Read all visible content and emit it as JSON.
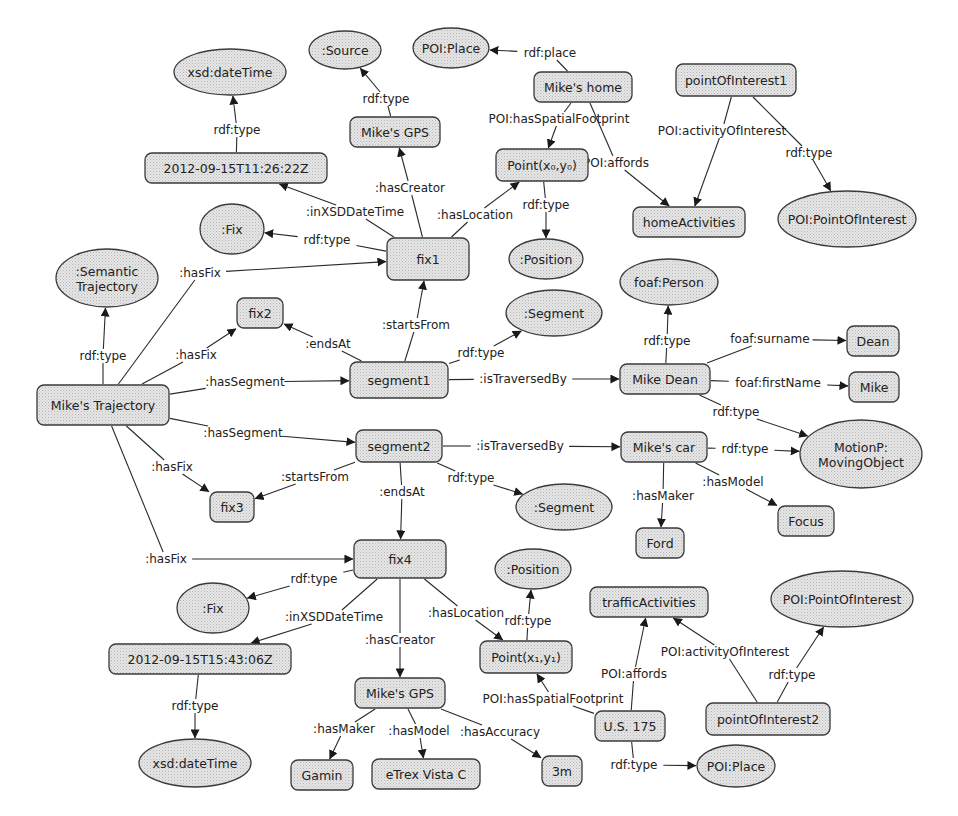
{
  "diagram": {
    "colors": {
      "node_fill": "#d9d9d9",
      "node_stroke": "#3a3a3a",
      "edge": "#2a2a2a",
      "background": "#ffffff"
    },
    "nodes": [
      {
        "id": "xsd_dt1",
        "label": "xsd:dateTime",
        "shape": "ellipse",
        "x": 230,
        "y": 72,
        "w": 112,
        "h": 46
      },
      {
        "id": "source",
        "label": ":Source",
        "shape": "ellipse",
        "x": 345,
        "y": 50,
        "w": 72,
        "h": 38
      },
      {
        "id": "poiplace1",
        "label": "POI:Place",
        "shape": "ellipse",
        "x": 451,
        "y": 48,
        "w": 76,
        "h": 40
      },
      {
        "id": "mikes_home",
        "label": "Mike's home",
        "shape": "rect",
        "x": 583,
        "y": 87,
        "w": 98,
        "h": 30
      },
      {
        "id": "poi1",
        "label": "pointOfInterest1",
        "shape": "rect",
        "x": 736,
        "y": 80,
        "w": 120,
        "h": 32
      },
      {
        "id": "mikes_gps1",
        "label": "Mike's GPS",
        "shape": "rect",
        "x": 395,
        "y": 132,
        "w": 90,
        "h": 30
      },
      {
        "id": "dt1",
        "label": "2012-09-15T11:26:22Z",
        "shape": "rect",
        "x": 236,
        "y": 168,
        "w": 182,
        "h": 30
      },
      {
        "id": "point0",
        "label": "Point(x₀,y₀)",
        "shape": "rect",
        "x": 542,
        "y": 165,
        "w": 92,
        "h": 32
      },
      {
        "id": "fix_class1",
        "label": ":Fix",
        "shape": "ellipse",
        "x": 232,
        "y": 229,
        "w": 64,
        "h": 50
      },
      {
        "id": "fix1",
        "label": "fix1",
        "shape": "rect",
        "x": 428,
        "y": 259,
        "w": 82,
        "h": 42
      },
      {
        "id": "position1",
        "label": ":Position",
        "shape": "ellipse",
        "x": 546,
        "y": 259,
        "w": 74,
        "h": 40
      },
      {
        "id": "homeact",
        "label": "homeActivities",
        "shape": "rect",
        "x": 689,
        "y": 222,
        "w": 112,
        "h": 30
      },
      {
        "id": "poi_class1",
        "label": "POI:PointOfInterest",
        "shape": "ellipse",
        "x": 847,
        "y": 219,
        "w": 138,
        "h": 56
      },
      {
        "id": "sem_traj",
        "label": ":Semantic\nTrajectory",
        "shape": "ellipse",
        "x": 107,
        "y": 278,
        "w": 102,
        "h": 58
      },
      {
        "id": "fix2",
        "label": "fix2",
        "shape": "rect",
        "x": 260,
        "y": 313,
        "w": 46,
        "h": 30
      },
      {
        "id": "segment_class1",
        "label": ":Segment",
        "shape": "ellipse",
        "x": 554,
        "y": 313,
        "w": 96,
        "h": 46
      },
      {
        "id": "foaf_person",
        "label": "foaf:Person",
        "shape": "ellipse",
        "x": 669,
        "y": 282,
        "w": 98,
        "h": 46
      },
      {
        "id": "dean",
        "label": "Dean",
        "shape": "rect",
        "x": 873,
        "y": 341,
        "w": 52,
        "h": 30
      },
      {
        "id": "mikes_traj",
        "label": "Mike's Trajectory",
        "shape": "rect",
        "x": 103,
        "y": 405,
        "w": 132,
        "h": 40
      },
      {
        "id": "segment1",
        "label": "segment1",
        "shape": "rect",
        "x": 399,
        "y": 380,
        "w": 98,
        "h": 36
      },
      {
        "id": "mike_dean",
        "label": "Mike Dean",
        "shape": "rect",
        "x": 665,
        "y": 379,
        "w": 90,
        "h": 30
      },
      {
        "id": "mike",
        "label": "Mike",
        "shape": "rect",
        "x": 874,
        "y": 387,
        "w": 50,
        "h": 30
      },
      {
        "id": "segment2",
        "label": "segment2",
        "shape": "rect",
        "x": 399,
        "y": 446,
        "w": 86,
        "h": 32
      },
      {
        "id": "mikes_car",
        "label": "Mike's car",
        "shape": "rect",
        "x": 664,
        "y": 447,
        "w": 86,
        "h": 30
      },
      {
        "id": "motionp",
        "label": "MotionP:\nMovingObject",
        "shape": "ellipse",
        "x": 861,
        "y": 454,
        "w": 122,
        "h": 68
      },
      {
        "id": "fix3",
        "label": "fix3",
        "shape": "rect",
        "x": 232,
        "y": 507,
        "w": 44,
        "h": 30
      },
      {
        "id": "segment_class2",
        "label": ":Segment",
        "shape": "ellipse",
        "x": 564,
        "y": 507,
        "w": 96,
        "h": 46
      },
      {
        "id": "focus",
        "label": "Focus",
        "shape": "rect",
        "x": 806,
        "y": 521,
        "w": 56,
        "h": 30
      },
      {
        "id": "ford",
        "label": "Ford",
        "shape": "rect",
        "x": 660,
        "y": 543,
        "w": 48,
        "h": 30
      },
      {
        "id": "fix4",
        "label": "fix4",
        "shape": "rect",
        "x": 400,
        "y": 559,
        "w": 92,
        "h": 38
      },
      {
        "id": "position2",
        "label": ":Position",
        "shape": "ellipse",
        "x": 533,
        "y": 569,
        "w": 76,
        "h": 40
      },
      {
        "id": "traffic",
        "label": "trafficActivities",
        "shape": "rect",
        "x": 649,
        "y": 602,
        "w": 118,
        "h": 30
      },
      {
        "id": "poi_class2",
        "label": "POI:PointOfInterest",
        "shape": "ellipse",
        "x": 842,
        "y": 599,
        "w": 142,
        "h": 56
      },
      {
        "id": "fix_class2",
        "label": ":Fix",
        "shape": "ellipse",
        "x": 213,
        "y": 608,
        "w": 72,
        "h": 50
      },
      {
        "id": "dt2",
        "label": "2012-09-15T15:43:06Z",
        "shape": "rect",
        "x": 200,
        "y": 659,
        "w": 182,
        "h": 30
      },
      {
        "id": "point1",
        "label": "Point(x₁,y₁)",
        "shape": "rect",
        "x": 526,
        "y": 657,
        "w": 92,
        "h": 32
      },
      {
        "id": "mikes_gps2",
        "label": "Mike's GPS",
        "shape": "rect",
        "x": 400,
        "y": 693,
        "w": 90,
        "h": 30
      },
      {
        "id": "poi2",
        "label": "pointOfInterest2",
        "shape": "rect",
        "x": 768,
        "y": 719,
        "w": 124,
        "h": 32
      },
      {
        "id": "us175",
        "label": "U.S. 175",
        "shape": "rect",
        "x": 630,
        "y": 726,
        "w": 70,
        "h": 30
      },
      {
        "id": "xsd_dt2",
        "label": "xsd:dateTime",
        "shape": "ellipse",
        "x": 195,
        "y": 763,
        "w": 112,
        "h": 48
      },
      {
        "id": "gamin",
        "label": "Gamin",
        "shape": "rect",
        "x": 322,
        "y": 775,
        "w": 62,
        "h": 30
      },
      {
        "id": "etrex",
        "label": "eTrex Vista C",
        "shape": "rect",
        "x": 426,
        "y": 774,
        "w": 108,
        "h": 30
      },
      {
        "id": "three_m",
        "label": "3m",
        "shape": "rect",
        "x": 562,
        "y": 771,
        "w": 40,
        "h": 30
      },
      {
        "id": "poiplace2",
        "label": "POI:Place",
        "shape": "ellipse",
        "x": 736,
        "y": 766,
        "w": 78,
        "h": 42
      }
    ],
    "edges": [
      {
        "from": "dt1",
        "to": "xsd_dt1",
        "label": "rdf:type",
        "lx": 237,
        "ly": 130
      },
      {
        "from": "mikes_gps1",
        "to": "source",
        "label": "rdf:type",
        "lx": 386,
        "ly": 99
      },
      {
        "from": "mikes_home",
        "to": "poiplace1",
        "label": "rdf:place",
        "lx": 550,
        "ly": 53
      },
      {
        "from": "mikes_home",
        "to": "point0",
        "label": "POI:hasSpatialFootprint",
        "lx": 559,
        "ly": 119
      },
      {
        "from": "mikes_home",
        "to": "homeact",
        "label": "POI:affords",
        "lx": 616,
        "ly": 163
      },
      {
        "from": "poi1",
        "to": "homeact",
        "label": "POI:activityOfInterest",
        "lx": 722,
        "ly": 131
      },
      {
        "from": "poi1",
        "to": "poi_class1",
        "label": "rdf:type",
        "lx": 809,
        "ly": 153
      },
      {
        "from": "fix1",
        "to": "mikes_gps1",
        "label": ":hasCreator",
        "lx": 410,
        "ly": 188
      },
      {
        "from": "fix1",
        "to": "dt1",
        "label": ":inXSDDateTime",
        "lx": 355,
        "ly": 212
      },
      {
        "from": "fix1",
        "to": "point0",
        "label": ":hasLocation",
        "lx": 475,
        "ly": 215
      },
      {
        "from": "point0",
        "to": "position1",
        "label": "rdf:type",
        "lx": 546,
        "ly": 205
      },
      {
        "from": "fix1",
        "to": "fix_class1",
        "label": "rdf:type",
        "lx": 327,
        "ly": 240
      },
      {
        "from": "mikes_traj",
        "to": "sem_traj",
        "label": "rdf:type",
        "lx": 103,
        "ly": 356
      },
      {
        "from": "mikes_traj",
        "to": "fix1",
        "label": ":hasFix",
        "lx": 200,
        "ly": 273
      },
      {
        "from": "mikes_traj",
        "to": "fix2",
        "label": ":hasFix",
        "lx": 196,
        "ly": 355
      },
      {
        "from": "segment1",
        "to": "fix2",
        "label": ":endsAt",
        "lx": 328,
        "ly": 344
      },
      {
        "from": "segment1",
        "to": "fix1",
        "label": ":startsFrom",
        "lx": 416,
        "ly": 325
      },
      {
        "from": "segment1",
        "to": "segment_class1",
        "label": "rdf:type",
        "lx": 481,
        "ly": 353
      },
      {
        "from": "mikes_traj",
        "to": "segment1",
        "label": ":hasSegment",
        "lx": 245,
        "ly": 382
      },
      {
        "from": "segment1",
        "to": "mike_dean",
        "label": ":isTraversedBy",
        "lx": 523,
        "ly": 379
      },
      {
        "from": "mike_dean",
        "to": "foaf_person",
        "label": "rdf:type",
        "lx": 667,
        "ly": 341
      },
      {
        "from": "mike_dean",
        "to": "dean",
        "label": "foaf:surname",
        "lx": 770,
        "ly": 339
      },
      {
        "from": "mike_dean",
        "to": "mike",
        "label": "foaf:firstName",
        "lx": 778,
        "ly": 383
      },
      {
        "from": "mike_dean",
        "to": "motionp",
        "label": "rdf:type",
        "lx": 736,
        "ly": 412
      },
      {
        "from": "mikes_traj",
        "to": "segment2",
        "label": ":hasSegment",
        "lx": 243,
        "ly": 433
      },
      {
        "from": "segment2",
        "to": "mikes_car",
        "label": ":isTraversedBy",
        "lx": 520,
        "ly": 446
      },
      {
        "from": "mikes_car",
        "to": "motionp",
        "label": "rdf:type",
        "lx": 745,
        "ly": 449
      },
      {
        "from": "mikes_traj",
        "to": "fix3",
        "label": ":hasFix",
        "lx": 172,
        "ly": 467
      },
      {
        "from": "segment2",
        "to": "fix3",
        "label": ":startsFrom",
        "lx": 315,
        "ly": 477
      },
      {
        "from": "segment2",
        "to": "fix4",
        "label": ":endsAt",
        "lx": 402,
        "ly": 492
      },
      {
        "from": "segment2",
        "to": "segment_class2",
        "label": "rdf:type",
        "lx": 471,
        "ly": 478
      },
      {
        "from": "mikes_car",
        "to": "ford",
        "label": ":hasMaker",
        "lx": 663,
        "ly": 496
      },
      {
        "from": "mikes_car",
        "to": "focus",
        "label": ":hasModel",
        "lx": 733,
        "ly": 482
      },
      {
        "from": "mikes_traj",
        "to": "fix4",
        "label": ":hasFix",
        "lx": 166,
        "ly": 559
      },
      {
        "from": "fix4",
        "to": "fix_class2",
        "label": "rdf:type",
        "lx": 314,
        "ly": 579
      },
      {
        "from": "fix4",
        "to": "dt2",
        "label": ":inXSDDateTime",
        "lx": 334,
        "ly": 617
      },
      {
        "from": "fix4",
        "to": "mikes_gps2",
        "label": ":hasCreator",
        "lx": 400,
        "ly": 640
      },
      {
        "from": "fix4",
        "to": "point1",
        "label": ":hasLocation",
        "lx": 466,
        "ly": 613
      },
      {
        "from": "point1",
        "to": "position2",
        "label": "rdf:type",
        "lx": 528,
        "ly": 621
      },
      {
        "from": "dt2",
        "to": "xsd_dt2",
        "label": "rdf:type",
        "lx": 195,
        "ly": 706
      },
      {
        "from": "mikes_gps2",
        "to": "gamin",
        "label": ":hasMaker",
        "lx": 344,
        "ly": 729
      },
      {
        "from": "mikes_gps2",
        "to": "etrex",
        "label": ":hasModel",
        "lx": 419,
        "ly": 731
      },
      {
        "from": "mikes_gps2",
        "to": "three_m",
        "label": ":hasAccuracy",
        "lx": 500,
        "ly": 732
      },
      {
        "from": "us175",
        "to": "point1",
        "label": "POI:hasSpatialFootprint",
        "lx": 553,
        "ly": 699
      },
      {
        "from": "us175",
        "to": "traffic",
        "label": "POI:affords",
        "lx": 634,
        "ly": 674
      },
      {
        "from": "poi2",
        "to": "traffic",
        "label": "POI:activityOfInterest",
        "lx": 725,
        "ly": 652
      },
      {
        "from": "poi2",
        "to": "poi_class2",
        "label": "rdf:type",
        "lx": 792,
        "ly": 675
      },
      {
        "from": "us175",
        "to": "poiplace2",
        "label": "rdf:type",
        "lx": 634,
        "ly": 765
      }
    ]
  }
}
